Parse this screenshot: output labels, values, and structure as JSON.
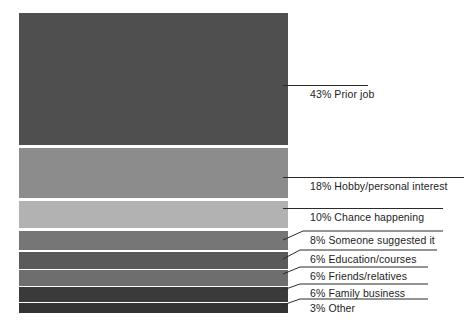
{
  "chart_data": {
    "type": "bar",
    "subtype": "stacked-100-single-column",
    "title": "",
    "subtitle": "",
    "xlabel": "",
    "ylabel": "",
    "ylim": [
      0,
      100
    ],
    "grid": false,
    "legend_position": "right-callouts",
    "units": "percent",
    "total": 100,
    "categories": [
      "Prior job",
      "Hobby/personal interest",
      "Chance happening",
      "Someone suggested it",
      "Education/courses",
      "Friends/relatives",
      "Family business",
      "Other"
    ],
    "values": [
      43,
      18,
      10,
      8,
      6,
      6,
      6,
      3
    ],
    "labels": [
      "43% Prior job",
      "18% Hobby/personal interest",
      "10% Chance happening",
      "8% Someone suggested it",
      "6% Education/courses",
      "6% Friends/relatives",
      "6% Family business",
      "3% Other"
    ],
    "colors": [
      "#4f4f4f",
      "#8c8c8c",
      "#b2b2b2",
      "#767676",
      "#5a5a5a",
      "#6e6e6e",
      "#3a3a3a",
      "#333333"
    ],
    "segments": [
      {
        "label": "43% Prior job",
        "percent": "43%",
        "name": "Prior job",
        "value": 43,
        "color": "#4f4f4f",
        "top": 0,
        "height": 132
      },
      {
        "label": "18% Hobby/personal interest",
        "percent": "18%",
        "name": "Hobby/personal interest",
        "value": 18,
        "color": "#8c8c8c",
        "top": 135,
        "height": 50
      },
      {
        "label": "10% Chance happening",
        "percent": "10%",
        "name": "Chance happening",
        "value": 10,
        "color": "#b2b2b2",
        "top": 188,
        "height": 27
      },
      {
        "label": "8% Someone suggested it",
        "percent": "8%",
        "name": "Someone suggested it",
        "value": 8,
        "color": "#767676",
        "top": 218,
        "height": 19
      },
      {
        "label": "6% Education/courses",
        "percent": "6%",
        "name": "Education/courses",
        "value": 6,
        "color": "#5a5a5a",
        "top": 239,
        "height": 17
      },
      {
        "label": "6% Friends/relatives",
        "percent": "6%",
        "name": "Friends/relatives",
        "value": 6,
        "color": "#6e6e6e",
        "top": 257,
        "height": 16
      },
      {
        "label": "6% Family business",
        "percent": "6%",
        "name": "Family business",
        "value": 6,
        "color": "#3a3a3a",
        "top": 274,
        "height": 15
      },
      {
        "label": "3% Other",
        "percent": "3%",
        "name": "Other",
        "value": 3,
        "color": "#333333",
        "top": 290,
        "height": 10
      }
    ]
  },
  "background_color": "#ffffff",
  "text_color": "#1d1d1d",
  "leader_color": "#2b2b2b"
}
